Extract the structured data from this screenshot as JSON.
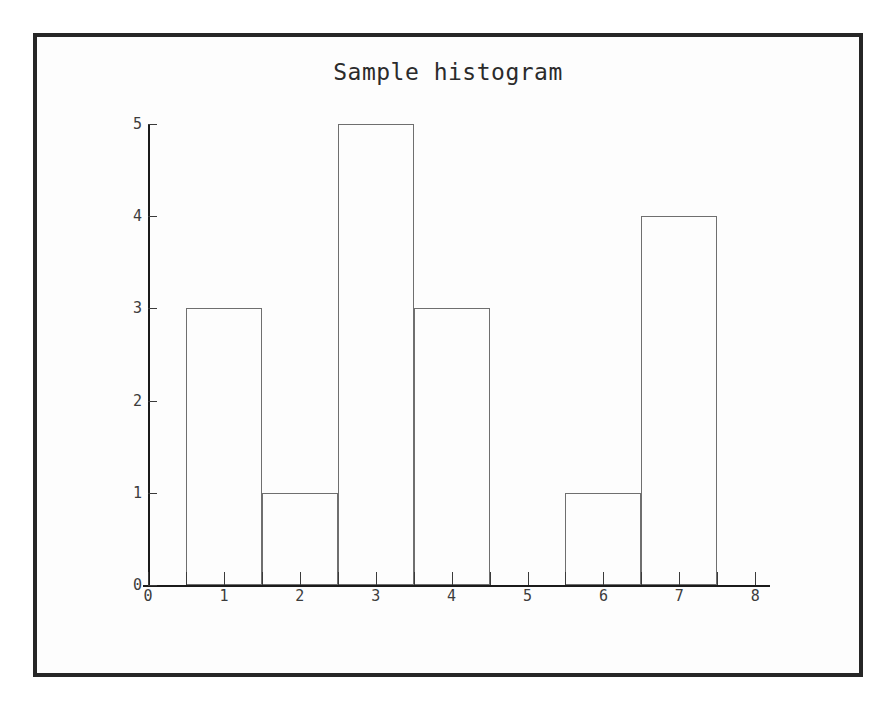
{
  "chart_data": {
    "type": "bar",
    "title": "Sample histogram",
    "xlabel": "",
    "ylabel": "",
    "categories": [
      "1",
      "2",
      "3",
      "4",
      "5",
      "6",
      "7",
      "8"
    ],
    "values": [
      3,
      1,
      5,
      3,
      0,
      1,
      4,
      0
    ],
    "bins": [
      {
        "label": "1",
        "center": 1,
        "left_edge": 0.5,
        "right_edge": 1.5,
        "count": 3
      },
      {
        "label": "2",
        "center": 2,
        "left_edge": 1.5,
        "right_edge": 2.5,
        "count": 1
      },
      {
        "label": "3",
        "center": 3,
        "left_edge": 2.5,
        "right_edge": 3.5,
        "count": 5
      },
      {
        "label": "4",
        "center": 4,
        "left_edge": 3.5,
        "right_edge": 4.5,
        "count": 3
      },
      {
        "label": "5",
        "center": 5,
        "left_edge": 4.5,
        "right_edge": 5.5,
        "count": 0
      },
      {
        "label": "6",
        "center": 6,
        "left_edge": 5.5,
        "right_edge": 6.5,
        "count": 1
      },
      {
        "label": "7",
        "center": 7,
        "left_edge": 6.5,
        "right_edge": 7.5,
        "count": 4
      },
      {
        "label": "8",
        "center": 8,
        "left_edge": 7.5,
        "right_edge": 8.5,
        "count": 0
      }
    ],
    "xlim": [
      0,
      8.2
    ],
    "ylim": [
      0,
      5
    ],
    "x_tick_labels": [
      "0",
      "1",
      "2",
      "3",
      "4",
      "5",
      "6",
      "7",
      "8"
    ],
    "x_tick_values": [
      0,
      1,
      2,
      3,
      4,
      5,
      6,
      7,
      8
    ],
    "x_minor_tick_values": [
      0.5,
      1.5,
      2.5,
      3.5,
      4.5,
      5.5,
      6.5,
      7.5
    ],
    "y_tick_labels": [
      "0",
      "1",
      "2",
      "3",
      "4",
      "5"
    ],
    "y_tick_values": [
      0,
      1,
      2,
      3,
      4,
      5
    ],
    "grid": false,
    "legend": null,
    "bar_fill": "none",
    "bar_edge_color": "#6f6f6f",
    "axis_color": "#1b1b1b",
    "background_color": "#fdfdfd",
    "frame_color": "#262626"
  }
}
